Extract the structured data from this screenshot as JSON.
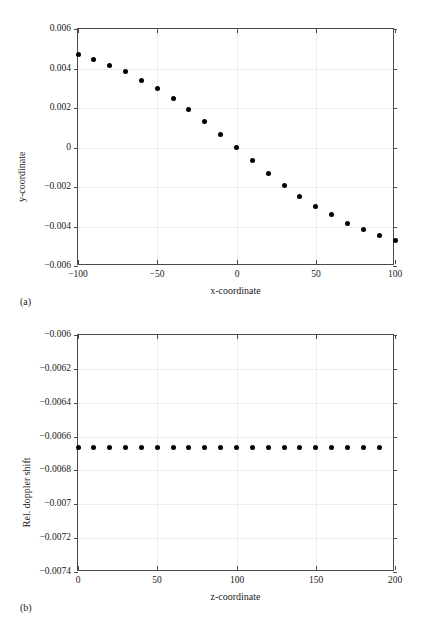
{
  "figure": {
    "background": "#ffffff",
    "marker_color": "#000000",
    "axis_color": "#4a4a4a",
    "grid_color": "#ededed"
  },
  "panels": [
    {
      "caption": "(a)",
      "chart_data": {
        "type": "scatter",
        "title": "",
        "xlabel": "x-coordinate",
        "ylabel": "y-coordinate",
        "xlim": [
          -100,
          100
        ],
        "ylim": [
          -0.006,
          0.006
        ],
        "xticks": [
          -100,
          -50,
          0,
          50,
          100
        ],
        "xticklabels": [
          "−100",
          "−50",
          "0",
          "50",
          "100"
        ],
        "yticks": [
          0.006,
          0.004,
          0.002,
          0,
          -0.002,
          -0.004,
          -0.006
        ],
        "yticklabels": [
          "0.006",
          "0.004",
          "0.002",
          "0",
          "−0.002",
          "−0.004",
          "−0.006"
        ],
        "grid": true,
        "legend": "none",
        "x": [
          -100,
          -90,
          -80,
          -70,
          -60,
          -50,
          -40,
          -30,
          -20,
          -10,
          0,
          10,
          20,
          30,
          40,
          50,
          60,
          70,
          80,
          90,
          100
        ],
        "y": [
          0.00472,
          0.00444,
          0.00416,
          0.00383,
          0.00341,
          0.00297,
          0.00248,
          0.00191,
          0.00132,
          0.00067,
          0.0,
          -0.00067,
          -0.00132,
          -0.00191,
          -0.00248,
          -0.00297,
          -0.00341,
          -0.00383,
          -0.00416,
          -0.00444,
          -0.00472
        ]
      }
    },
    {
      "caption": "(b)",
      "chart_data": {
        "type": "scatter",
        "title": "",
        "xlabel": "z-coordinate",
        "ylabel": "Rel. doppler shift",
        "xlim": [
          0,
          200
        ],
        "ylim": [
          -0.0074,
          -0.006
        ],
        "xticks": [
          0,
          50,
          100,
          150,
          200
        ],
        "xticklabels": [
          "0",
          "50",
          "100",
          "150",
          "200"
        ],
        "yticks": [
          -0.006,
          -0.0062,
          -0.0064,
          -0.0066,
          -0.0068,
          -0.007,
          -0.0072,
          -0.0074
        ],
        "yticklabels": [
          "−0.006",
          "−0.0062",
          "−0.0064",
          "−0.0066",
          "−0.0068",
          "−0.007",
          "−0.0072",
          "−0.0074"
        ],
        "grid": true,
        "legend": "none",
        "x": [
          0,
          10,
          20,
          30,
          40,
          50,
          60,
          70,
          80,
          90,
          100,
          110,
          120,
          130,
          140,
          150,
          160,
          170,
          180,
          190
        ],
        "y": [
          -0.006663,
          -0.006663,
          -0.006663,
          -0.006663,
          -0.006663,
          -0.006663,
          -0.006663,
          -0.006663,
          -0.006663,
          -0.006663,
          -0.006663,
          -0.006663,
          -0.006663,
          -0.006663,
          -0.006663,
          -0.006663,
          -0.006663,
          -0.006663,
          -0.006663,
          -0.006663
        ]
      }
    }
  ]
}
